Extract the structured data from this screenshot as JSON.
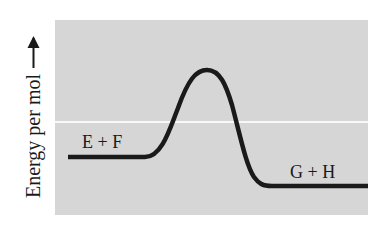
{
  "diagram": {
    "type": "reaction-energy-profile",
    "y_axis_label": "Energy per mol",
    "y_axis_direction": "up-arrow",
    "reactants_label": "E + F",
    "products_label": "G + H",
    "reaction": "exergonic",
    "colors": {
      "panel": "#d6d6d6",
      "curve": "#1a1a1a",
      "reference_line": "#f8f8f8"
    }
  }
}
